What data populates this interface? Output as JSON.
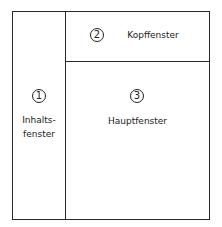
{
  "diagram": {
    "regions": [
      {
        "number": "1",
        "label_line1": "Inhalts-",
        "label_line2": "fenster"
      },
      {
        "number": "2",
        "label": "Kopffenster"
      },
      {
        "number": "3",
        "label": "Hauptfenster"
      }
    ]
  }
}
